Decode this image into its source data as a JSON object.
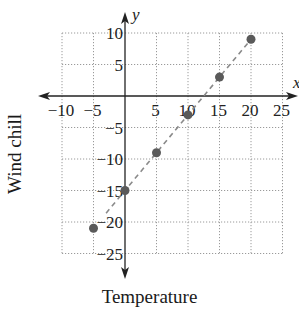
{
  "chart_data": {
    "type": "scatter",
    "title": "",
    "xlabel": "Temperature",
    "ylabel": "Wind chill",
    "x_axis_symbol": "x",
    "y_axis_symbol": "y",
    "xlim": [
      -10,
      25
    ],
    "ylim": [
      -25,
      10
    ],
    "grid": true,
    "grid_style": "dotted",
    "x_ticks": [
      -10,
      -5,
      5,
      10,
      15,
      20,
      25
    ],
    "x_tick_labels": [
      "−10",
      "−5",
      "5",
      "10",
      "15",
      "20",
      "25"
    ],
    "y_ticks": [
      10,
      5,
      -5,
      -10,
      -15,
      -20,
      -25
    ],
    "y_tick_labels": [
      "10",
      "5",
      "−5",
      "−10",
      "−15",
      "−20",
      "−25"
    ],
    "series": [
      {
        "name": "Wind chill data",
        "type": "scatter",
        "x": [
          -5,
          0,
          5,
          10,
          15,
          20
        ],
        "y": [
          -21,
          -15,
          -9,
          -3,
          3,
          9
        ],
        "color": "#5a5a5a"
      },
      {
        "name": "Trend line",
        "type": "line",
        "style": "dashed",
        "x": [
          -3,
          20
        ],
        "y": [
          -18.6,
          9
        ],
        "color": "#8a8a8a"
      }
    ],
    "legend": null
  },
  "labels": {
    "xlabel": "Temperature",
    "ylabel": "Wind chill"
  }
}
